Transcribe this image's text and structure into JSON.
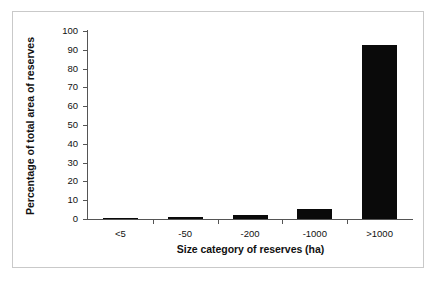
{
  "chart_data": {
    "type": "bar",
    "title": "",
    "xlabel": "Size category of reserves (ha)",
    "ylabel": "Percentage of total area of reserves",
    "categories": [
      "<5",
      "-50",
      "-200",
      "-1000",
      ">1000"
    ],
    "values": [
      0.3,
      1.0,
      2.0,
      5.5,
      92.5
    ],
    "series": [
      {
        "name": "Percentage of total area of reserves",
        "values": [
          0.3,
          1.0,
          2.0,
          5.5,
          92.5
        ]
      }
    ],
    "ylim": [
      0,
      100
    ],
    "ytick_labels": [
      "0",
      "10",
      "20",
      "30",
      "40",
      "50",
      "60",
      "70",
      "80",
      "90",
      "100"
    ],
    "ytick_values": [
      0,
      10,
      20,
      30,
      40,
      50,
      60,
      70,
      80,
      90,
      100
    ],
    "grid": false,
    "legend": false,
    "legend_position": "none",
    "bar_color": "#0a0a0a",
    "axis_color": "#555555",
    "frame_color": "#c9c9c9",
    "background_color": "#ffffff"
  }
}
